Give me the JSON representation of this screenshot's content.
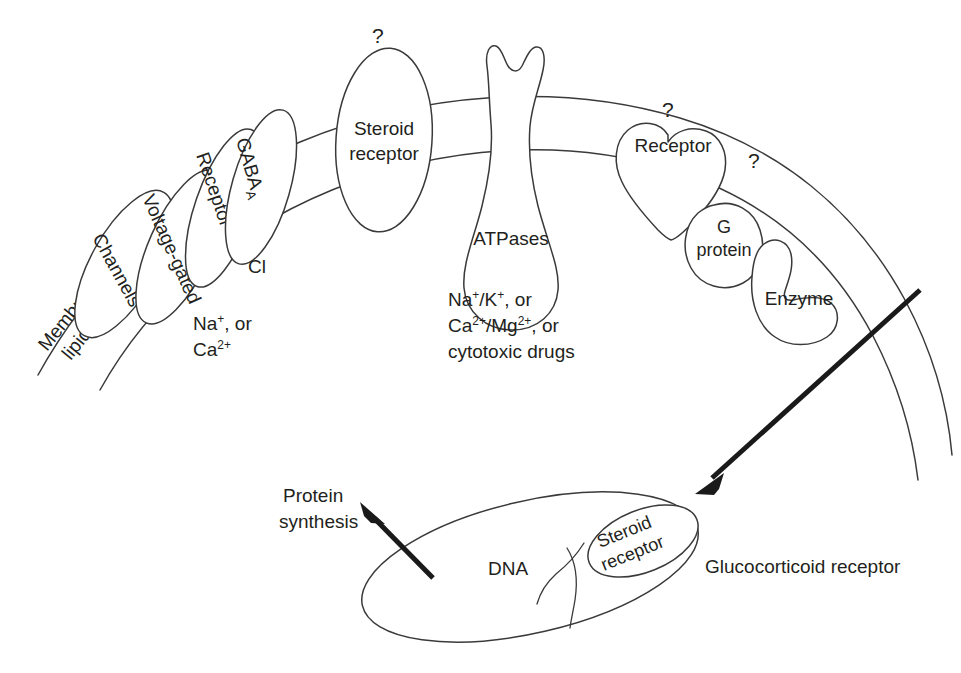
{
  "figure": {
    "background_color": "#ffffff",
    "line_color": "#3a3a3a",
    "text_color": "#231f20",
    "arrow_color": "#1a1a1a"
  },
  "membrane": {
    "label_line1": "Membrane",
    "label_line2": "lipids"
  },
  "targets": {
    "channels": {
      "label": "Channels",
      "modifier": "Voltage-gated",
      "ions_line1": "Na",
      "ions_line1_sup": "+",
      "ions_line1_tail": ", or",
      "ions_line2": "Ca",
      "ions_line2_sup": "2+"
    },
    "gaba": {
      "receptor_label": "Receptor",
      "gaba_label": "GABA",
      "gaba_subscript": "A",
      "ion_label": "Cl"
    },
    "steroid_membrane": {
      "label_line1": "Steroid",
      "label_line2": "receptor",
      "question_mark": "?"
    },
    "atpases": {
      "label": "ATPases",
      "substrates_line1_a": "Na",
      "substrates_line1_a_sup": "+",
      "substrates_line1_b": "/K",
      "substrates_line1_b_sup": "+",
      "substrates_line1_tail": ", or",
      "substrates_line2_a": "Ca",
      "substrates_line2_a_sup": "2+",
      "substrates_line2_b": "/Mg",
      "substrates_line2_b_sup": "2+",
      "substrates_line2_tail": ", or",
      "substrates_line3": "cytotoxic drugs"
    },
    "gpcr": {
      "receptor_label": "Receptor",
      "receptor_question_mark": "?",
      "g_protein_line1": "G",
      "g_protein_line2": "protein",
      "enzyme_label": "Enzyme",
      "enzyme_question_mark": "?"
    }
  },
  "nucleus": {
    "dna_label": "DNA",
    "steroid_receptor_line1": "Steroid",
    "steroid_receptor_line2": "receptor",
    "external_label": "Glucocorticoid receptor"
  },
  "outputs": {
    "protein_synthesis_line1": "Protein",
    "protein_synthesis_line2": "synthesis"
  }
}
